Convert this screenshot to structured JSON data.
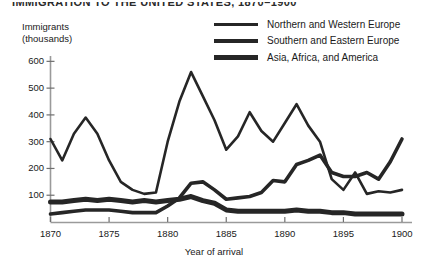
{
  "title": "IMMIGRATION TO THE UNITED STATES, 1870–1900",
  "axis": {
    "y_label": "Immigrants\n(thousands)",
    "x_label": "Year of arrival",
    "y_ticks": [
      100,
      200,
      300,
      400,
      500,
      600
    ],
    "x_ticks": [
      1870,
      1875,
      1880,
      1885,
      1890,
      1895,
      1900
    ]
  },
  "legend": {
    "items": [
      {
        "label": "Northern and Western Europe",
        "key": "key-thin"
      },
      {
        "label": "Southern and Eastern Europe",
        "key": "key-medium"
      },
      {
        "label": "Asia, Africa, and America",
        "key": "key-thick"
      }
    ]
  },
  "colors": {
    "line": "#262626",
    "axis": "#9a9a9a",
    "text": "#1a1a1a"
  },
  "chart_data": {
    "type": "line",
    "title": "IMMIGRATION TO THE UNITED STATES, 1870–1900",
    "xlabel": "Year of arrival",
    "ylabel": "Immigrants (thousands)",
    "xlim": [
      1870,
      1900
    ],
    "ylim": [
      0,
      620
    ],
    "grid": false,
    "legend_position": "top-right",
    "x": [
      1870,
      1871,
      1872,
      1873,
      1874,
      1875,
      1876,
      1877,
      1878,
      1879,
      1880,
      1881,
      1882,
      1883,
      1884,
      1885,
      1886,
      1887,
      1888,
      1889,
      1890,
      1891,
      1892,
      1893,
      1894,
      1895,
      1896,
      1897,
      1898,
      1899,
      1900
    ],
    "series": [
      {
        "name": "Northern and Western Europe",
        "values": [
          310,
          230,
          330,
          390,
          330,
          230,
          150,
          120,
          105,
          110,
          300,
          450,
          560,
          470,
          380,
          270,
          320,
          410,
          340,
          300,
          370,
          440,
          360,
          300,
          160,
          120,
          185,
          105,
          115,
          110,
          120
        ]
      },
      {
        "name": "Southern and Eastern Europe",
        "values": [
          30,
          35,
          40,
          45,
          45,
          45,
          40,
          35,
          35,
          35,
          60,
          90,
          145,
          150,
          120,
          85,
          90,
          95,
          110,
          155,
          150,
          215,
          230,
          250,
          185,
          170,
          170,
          185,
          160,
          225,
          310
        ]
      },
      {
        "name": "Asia, Africa, and America",
        "values": [
          75,
          75,
          80,
          85,
          80,
          85,
          80,
          75,
          80,
          75,
          80,
          85,
          95,
          80,
          70,
          45,
          40,
          40,
          40,
          40,
          40,
          45,
          40,
          40,
          35,
          35,
          30,
          30,
          30,
          30,
          30
        ]
      }
    ]
  }
}
